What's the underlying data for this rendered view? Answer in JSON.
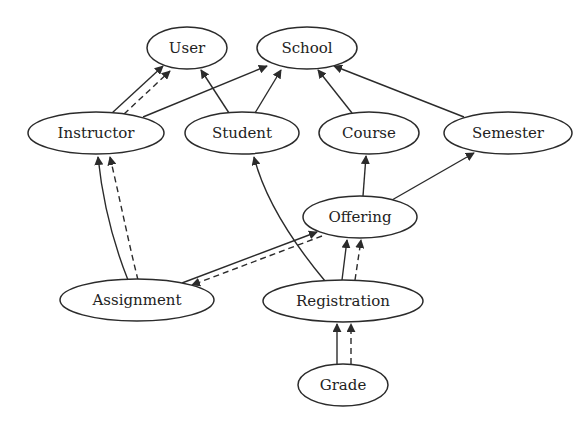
{
  "diagram": {
    "type": "directed-graph",
    "edge_styles": {
      "solid": "solid line with filled arrowhead",
      "dashed": "dashed line with filled arrowhead"
    },
    "colors": {
      "stroke": "#2b2b2b",
      "text": "#222222",
      "background": "#ffffff"
    },
    "nodes": [
      {
        "id": "user",
        "label": "User",
        "cx": 187,
        "cy": 48,
        "rx": 40,
        "ry": 21
      },
      {
        "id": "school",
        "label": "School",
        "cx": 307,
        "cy": 48,
        "rx": 50,
        "ry": 21
      },
      {
        "id": "instructor",
        "label": "Instructor",
        "cx": 96,
        "cy": 133,
        "rx": 68,
        "ry": 21
      },
      {
        "id": "student",
        "label": "Student",
        "cx": 242,
        "cy": 133,
        "rx": 57,
        "ry": 21
      },
      {
        "id": "course",
        "label": "Course",
        "cx": 369,
        "cy": 133,
        "rx": 50,
        "ry": 21
      },
      {
        "id": "semester",
        "label": "Semester",
        "cx": 508,
        "cy": 133,
        "rx": 64,
        "ry": 21
      },
      {
        "id": "offering",
        "label": "Offering",
        "cx": 360,
        "cy": 217,
        "rx": 57,
        "ry": 21
      },
      {
        "id": "assignment",
        "label": "Assignment",
        "cx": 137,
        "cy": 300,
        "rx": 77,
        "ry": 21
      },
      {
        "id": "registration",
        "label": "Registration",
        "cx": 343,
        "cy": 301,
        "rx": 80,
        "ry": 21
      },
      {
        "id": "grade",
        "label": "Grade",
        "cx": 343,
        "cy": 385,
        "rx": 45,
        "ry": 21
      }
    ],
    "edges": [
      {
        "from": "instructor",
        "to": "user",
        "style": "solid"
      },
      {
        "from": "instructor",
        "to": "user",
        "style": "dashed"
      },
      {
        "from": "instructor",
        "to": "school",
        "style": "solid"
      },
      {
        "from": "student",
        "to": "user",
        "style": "solid"
      },
      {
        "from": "student",
        "to": "school",
        "style": "solid"
      },
      {
        "from": "course",
        "to": "school",
        "style": "solid"
      },
      {
        "from": "semester",
        "to": "school",
        "style": "solid"
      },
      {
        "from": "offering",
        "to": "course",
        "style": "solid"
      },
      {
        "from": "offering",
        "to": "semester",
        "style": "solid"
      },
      {
        "from": "assignment",
        "to": "instructor",
        "style": "solid"
      },
      {
        "from": "assignment",
        "to": "instructor",
        "style": "dashed"
      },
      {
        "from": "assignment",
        "to": "offering",
        "style": "solid"
      },
      {
        "from": "offering",
        "to": "assignment",
        "style": "dashed"
      },
      {
        "from": "registration",
        "to": "student",
        "style": "solid"
      },
      {
        "from": "registration",
        "to": "offering",
        "style": "solid"
      },
      {
        "from": "registration",
        "to": "offering",
        "style": "dashed"
      },
      {
        "from": "grade",
        "to": "registration",
        "style": "solid"
      },
      {
        "from": "grade",
        "to": "registration",
        "style": "dashed"
      }
    ]
  }
}
